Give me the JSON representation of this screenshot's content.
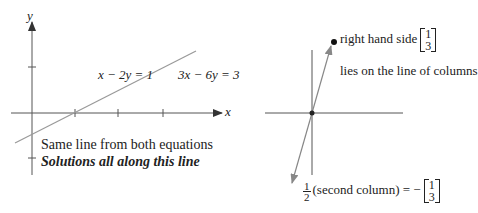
{
  "left_figure": {
    "axis_x_label": "x",
    "axis_y_label": "y",
    "equation_1": "x − 2y = 1",
    "equation_2": "3x − 6y = 3",
    "caption_line_1": "Same line from both equations",
    "caption_line_2": "Solutions all along this line",
    "line_color": "#999999",
    "axis_color": "#555555"
  },
  "right_figure": {
    "point_label": "right hand side",
    "point_vector": [
      "1",
      "3"
    ],
    "line_note": "lies on the line of columns",
    "fraction_num": "1",
    "fraction_den": "2",
    "bottom_label": "(second column) = −",
    "bottom_vector": [
      "1",
      "3"
    ]
  }
}
